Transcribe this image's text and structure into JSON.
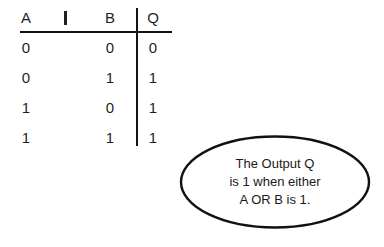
{
  "table": {
    "headers": [
      "A",
      "I",
      "B",
      "Q"
    ],
    "rows": [
      {
        "a": "0",
        "b": "0",
        "q": "0"
      },
      {
        "a": "0",
        "b": "1",
        "q": "1"
      },
      {
        "a": "1",
        "b": "0",
        "q": "1"
      },
      {
        "a": "1",
        "b": "1",
        "q": "1"
      }
    ]
  },
  "callout": {
    "line1": "The Output Q",
    "line2": "is 1 when either",
    "line3": "A OR B is 1."
  },
  "colors": {
    "ink": "#1a1a1a",
    "rule": "#141414",
    "background": "#ffffff"
  }
}
